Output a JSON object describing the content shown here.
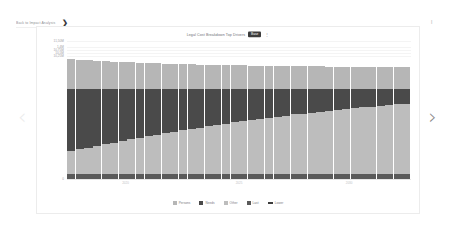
{
  "breadcrumb": {
    "text": "Back to Impact Analysis",
    "chevron": "❯"
  },
  "nav": {
    "prev_icon": "‹",
    "next_icon": "›"
  },
  "corner": {
    "mark": "❙"
  },
  "chart_header": {
    "title": "Legal Cost Breakdown Top Drivers",
    "badge": "Base",
    "icon": "⋮"
  },
  "legend": {
    "items": [
      {
        "label": "Persons",
        "color": "#b6b6b6",
        "shape": "square"
      },
      {
        "label": "Needs",
        "color": "#4a4a4a",
        "shape": "square"
      },
      {
        "label": "Other",
        "color": "#bdbdbd",
        "shape": "square"
      },
      {
        "label": "Last",
        "color": "#5a5a5a",
        "shape": "square"
      },
      {
        "label": "Lower",
        "color": "#3c3c3c",
        "shape": "line"
      }
    ]
  },
  "chart_data": {
    "type": "bar",
    "title": "Legal Cost Breakdown Top Drivers",
    "xlabel": "",
    "ylabel": "",
    "stacked": true,
    "grid": true,
    "legend_position": "bottom",
    "ylim": [
      0,
      11500
    ],
    "ytick_labels": [
      "11,50M",
      "1,4M",
      "10,75M",
      "10,5M",
      "10,25M",
      "0"
    ],
    "ytick_values": [
      11500,
      11000,
      10750,
      10500,
      10250,
      0
    ],
    "categories": [
      "1",
      "2",
      "3",
      "4",
      "5",
      "6",
      "7",
      "8",
      "9",
      "10",
      "11",
      "12",
      "13",
      "14",
      "15",
      "16",
      "17",
      "18",
      "19",
      "20",
      "21",
      "22",
      "23",
      "24",
      "25",
      "26",
      "27",
      "28",
      "29",
      "30",
      "31",
      "32",
      "33",
      "34",
      "35",
      "36",
      "37",
      "38",
      "39",
      "40"
    ],
    "xtick_labels": [
      "",
      "2020",
      "",
      "2025",
      "",
      "2030",
      ""
    ],
    "xtick_positions": [
      0.02,
      0.17,
      0.33,
      0.5,
      0.66,
      0.82,
      0.97
    ],
    "series": [
      {
        "name": "Persons",
        "color": "#b6b6b6",
        "values": [
          2500,
          2420,
          2380,
          2340,
          2300,
          2260,
          2230,
          2200,
          2170,
          2150,
          2120,
          2100,
          2080,
          2060,
          2040,
          2020,
          2000,
          1985,
          1970,
          1955,
          1945,
          1930,
          1920,
          1910,
          1900,
          1890,
          1885,
          1875,
          1870,
          1862,
          1855,
          1850,
          1845,
          1840,
          1835,
          1830,
          1828,
          1825,
          1822,
          1820
        ]
      },
      {
        "name": "Needs",
        "color": "#4a4a4a",
        "values": [
          5200,
          5050,
          4900,
          4760,
          4620,
          4480,
          4340,
          4210,
          4080,
          3950,
          3820,
          3700,
          3580,
          3460,
          3340,
          3230,
          3120,
          3010,
          2900,
          2800,
          2700,
          2600,
          2500,
          2410,
          2320,
          2230,
          2140,
          2060,
          1980,
          1900,
          1820,
          1750,
          1680,
          1610,
          1540,
          1480,
          1420,
          1360,
          1300,
          1250
        ]
      },
      {
        "name": "Other",
        "color": "#bdbdbd",
        "values": [
          1900,
          2050,
          2200,
          2340,
          2480,
          2620,
          2760,
          2890,
          3020,
          3150,
          3280,
          3400,
          3520,
          3640,
          3760,
          3870,
          3980,
          4090,
          4200,
          4300,
          4400,
          4500,
          4600,
          4690,
          4780,
          4870,
          4960,
          5040,
          5120,
          5200,
          5280,
          5350,
          5420,
          5490,
          5560,
          5620,
          5680,
          5740,
          5800,
          5850
        ]
      },
      {
        "name": "Last",
        "color": "#5a5a5a",
        "values": [
          420,
          420,
          420,
          420,
          420,
          420,
          420,
          420,
          420,
          420,
          420,
          420,
          420,
          420,
          420,
          420,
          420,
          420,
          420,
          420,
          420,
          420,
          420,
          420,
          420,
          420,
          420,
          420,
          420,
          420,
          420,
          420,
          420,
          420,
          420,
          420,
          420,
          420,
          420,
          420
        ]
      }
    ]
  }
}
